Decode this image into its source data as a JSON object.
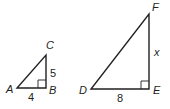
{
  "figure": {
    "triangles": [
      {
        "name": "ABC",
        "vertices": {
          "A": "A",
          "B": "B",
          "C": "C"
        },
        "right_angle_at": "B",
        "sides": {
          "AB": "4",
          "BC": "5"
        }
      },
      {
        "name": "DEF",
        "vertices": {
          "D": "D",
          "E": "E",
          "F": "F"
        },
        "right_angle_at": "E",
        "sides": {
          "DE": "8",
          "EF": "x"
        }
      }
    ]
  }
}
